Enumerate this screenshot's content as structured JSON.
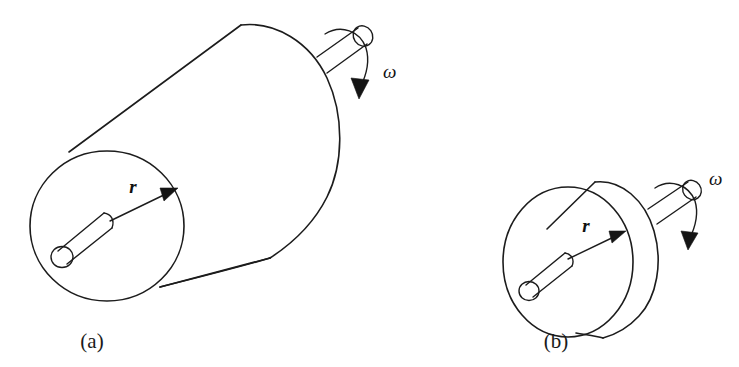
{
  "figure": {
    "background_color": "#ffffff",
    "ink_color": "#1c1c1c",
    "caption_a": "(a)",
    "caption_b": "(b)",
    "panels": [
      {
        "id": "panel-a",
        "caption": "(a)",
        "shape": "long-cylinder",
        "radius_label": "r",
        "angular_velocity_label": "ω",
        "description": "Long solid cylinder rotating about its axis, radius r, angular velocity omega"
      },
      {
        "id": "panel-b",
        "caption": "(b)",
        "shape": "short-disk",
        "radius_label": "r",
        "angular_velocity_label": "ω",
        "description": "Short disk rotating about its axis, radius r, angular velocity omega"
      }
    ]
  },
  "labels": {
    "radius_a": "r",
    "radius_b": "r",
    "omega_a": "ω",
    "omega_b": "ω"
  }
}
